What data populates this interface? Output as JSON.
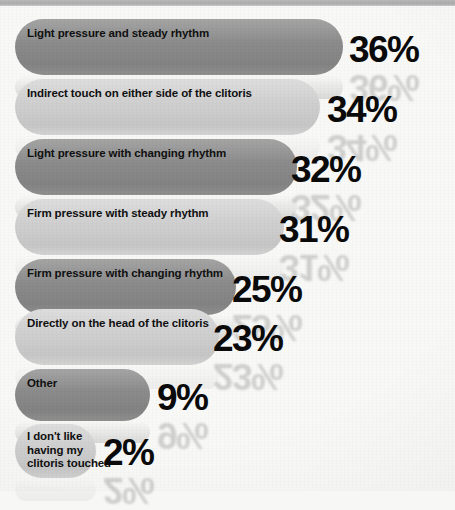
{
  "chart_data": {
    "type": "bar",
    "orientation": "horizontal",
    "title": "",
    "subtitle": "",
    "xlabel": "",
    "ylabel": "",
    "xlim": [
      0,
      36
    ],
    "grid": false,
    "legend": false,
    "value_suffix": "%",
    "categories": [
      "Light pressure and steady rhythm",
      "Indirect touch on either side of the clitoris",
      "Light pressure with changing rhythm",
      "Firm pressure with steady rhythm",
      "Firm pressure with changing rhythm",
      "Directly on the head of the clitoris",
      "Other",
      "I don't like\nhaving my\nclitoris touched"
    ],
    "values": [
      36,
      34,
      32,
      31,
      25,
      23,
      9,
      2
    ],
    "value_labels": [
      "36%",
      "34%",
      "32%",
      "31%",
      "25%",
      "23%",
      "9%",
      "2%"
    ],
    "colors": {
      "bar_dark": "#8b8b8b",
      "bar_light": "#cfcfcf",
      "value_text": "#0a0a0a",
      "label_text": "#101010",
      "background": "#f7f7f6",
      "top_strip": "#adadad"
    },
    "bars": [
      {
        "label": "Light pressure and steady rhythm",
        "value": 36,
        "value_label": "36%",
        "shade": "dark",
        "top": 19,
        "height": 56,
        "end_x": 343,
        "label_top": 27,
        "pct_left": 349,
        "pct_top": 31
      },
      {
        "label": "Indirect touch on either side of the clitoris",
        "value": 34,
        "value_label": "34%",
        "shade": "light",
        "top": 79,
        "height": 56,
        "end_x": 320,
        "label_top": 87,
        "pct_left": 327,
        "pct_top": 91
      },
      {
        "label": "Light pressure with changing rhythm",
        "value": 32,
        "value_label": "32%",
        "shade": "dark",
        "top": 139,
        "height": 56,
        "end_x": 297,
        "label_top": 147,
        "pct_left": 291,
        "pct_top": 151
      },
      {
        "label": "Firm pressure with steady rhythm",
        "value": 31,
        "value_label": "31%",
        "shade": "light",
        "top": 199,
        "height": 56,
        "end_x": 284,
        "label_top": 207,
        "pct_left": 279,
        "pct_top": 211
      },
      {
        "label": "Firm pressure with changing rhythm",
        "value": 25,
        "value_label": "25%",
        "shade": "dark",
        "top": 259,
        "height": 56,
        "end_x": 236,
        "label_top": 267,
        "pct_left": 232,
        "pct_top": 271
      },
      {
        "label": "Directly on the head of the clitoris",
        "value": 23,
        "value_label": "23%",
        "shade": "light",
        "top": 309,
        "height": 56,
        "end_x": 219,
        "label_top": 317,
        "pct_left": 213,
        "pct_top": 320
      },
      {
        "label": "Other",
        "value": 9,
        "value_label": "9%",
        "shade": "dark",
        "top": 369,
        "height": 52,
        "end_x": 150,
        "label_top": 377,
        "pct_left": 157,
        "pct_top": 379
      },
      {
        "label": "I don't like\nhaving my\nclitoris touched",
        "value": 2,
        "value_label": "2%",
        "shade": "light",
        "top": 424,
        "height": 54,
        "end_x": 96,
        "label_top": 430,
        "pct_left": 103,
        "pct_top": 434
      }
    ]
  }
}
